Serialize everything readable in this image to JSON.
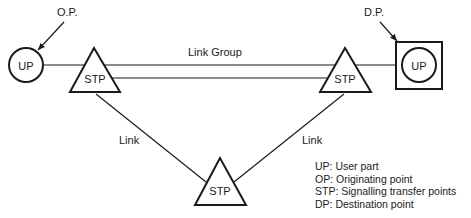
{
  "diagram": {
    "type": "signalling-network",
    "nodes": {
      "origin_up": {
        "label": "UP",
        "annotation": "O.P."
      },
      "stp_left": {
        "label": "STP"
      },
      "stp_right": {
        "label": "STP"
      },
      "stp_bottom": {
        "label": "STP"
      },
      "dest_up": {
        "label": "UP",
        "annotation": "D.P."
      }
    },
    "edges": {
      "link_group": {
        "label": "Link Group"
      },
      "link_left": {
        "label": "Link"
      },
      "link_right": {
        "label": "Link"
      }
    },
    "legend": [
      {
        "text": "UP: User part"
      },
      {
        "text": "OP: Originating point"
      },
      {
        "text": "STP: Signalling transfer points"
      },
      {
        "text": "DP: Destination point"
      }
    ]
  },
  "colors": {
    "stroke": "#1a1a1a",
    "background": "#ffffff"
  }
}
